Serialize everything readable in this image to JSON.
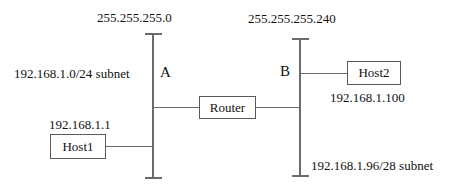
{
  "diagram": {
    "type": "network-diagram",
    "colors": {
      "line": "#6b6b6b",
      "box_border": "#5a5a5a",
      "text": "#111111",
      "background": "#ffffff"
    }
  },
  "labels": {
    "left_mask": "255.255.255.0",
    "right_mask": "255.255.255.240",
    "left_subnet": "192.168.1.0/24 subnet",
    "right_subnet": "192.168.1.96/28 subnet",
    "host1_ip": "192.168.1.1",
    "host2_ip": "192.168.1.100",
    "interface_a": "A",
    "interface_b": "B"
  },
  "nodes": {
    "router": "Router",
    "host1": "Host1",
    "host2": "Host2"
  }
}
